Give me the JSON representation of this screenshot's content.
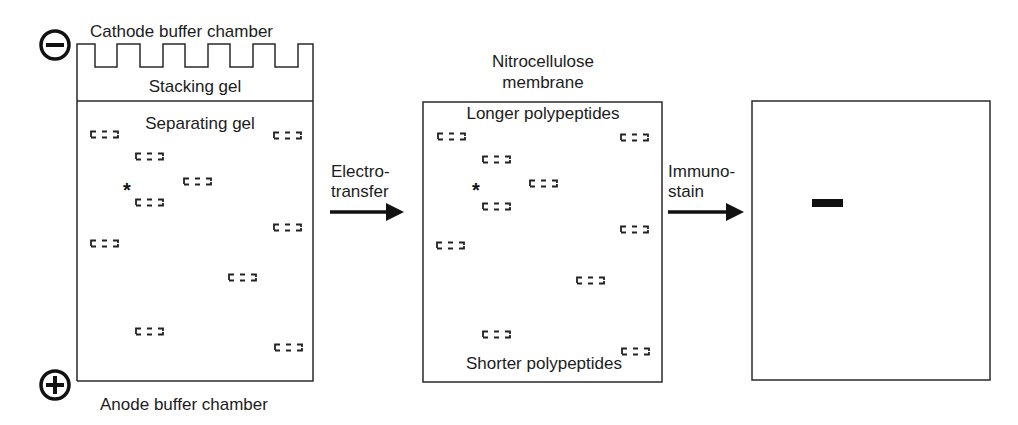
{
  "figure": {
    "type": "western-blot-schematic",
    "colors": {
      "line": "#2a2a2a",
      "band_dashed": "#222222",
      "stained_band": "#111111",
      "background": "#ffffff"
    }
  },
  "electrodes": {
    "cathode_symbol": "−",
    "anode_symbol": "+",
    "cathode_label": "Cathode buffer chamber",
    "anode_label": "Anode buffer chamber"
  },
  "gel": {
    "stacking_label": "Stacking gel",
    "separating_label": "Separating gel",
    "marker_symbol": "*",
    "bands": [
      {
        "x": 90,
        "y": 125
      },
      {
        "x": 273,
        "y": 126
      },
      {
        "x": 135,
        "y": 147
      },
      {
        "x": 183,
        "y": 172
      },
      {
        "x": 135,
        "y": 193
      },
      {
        "x": 273,
        "y": 218
      },
      {
        "x": 90,
        "y": 234
      },
      {
        "x": 228,
        "y": 268
      },
      {
        "x": 135,
        "y": 322
      },
      {
        "x": 274,
        "y": 338
      }
    ],
    "marker_position": {
      "x": 123,
      "y": 180
    }
  },
  "step1": {
    "line1": "Electro-",
    "line2": "transfer"
  },
  "membrane": {
    "title_line1": "Nitrocellulose",
    "title_line2": "membrane",
    "top_label": "Longer polypeptides",
    "bottom_label": "Shorter polypeptides",
    "marker_symbol": "*",
    "bands": [
      {
        "x": 437,
        "y": 127
      },
      {
        "x": 620,
        "y": 128
      },
      {
        "x": 482,
        "y": 150
      },
      {
        "x": 529,
        "y": 174
      },
      {
        "x": 482,
        "y": 197
      },
      {
        "x": 620,
        "y": 220
      },
      {
        "x": 436,
        "y": 236
      },
      {
        "x": 576,
        "y": 271
      },
      {
        "x": 482,
        "y": 325
      },
      {
        "x": 621,
        "y": 342
      }
    ],
    "marker_position": {
      "x": 472,
      "y": 180
    }
  },
  "step2": {
    "line1": "Immuno-",
    "line2": "stain"
  },
  "result": {
    "stained_band": {
      "x": 812,
      "y": 199,
      "width": 31,
      "height": 8
    }
  }
}
